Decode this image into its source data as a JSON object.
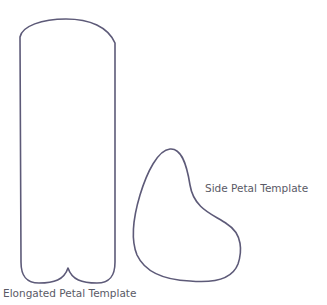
{
  "shapes": {
    "elongated": {
      "label": "Elongated Petal Template"
    },
    "side": {
      "label": "Side Petal Template"
    }
  },
  "colors": {
    "stroke": "#5d5a78",
    "text": "#5a5a66"
  }
}
